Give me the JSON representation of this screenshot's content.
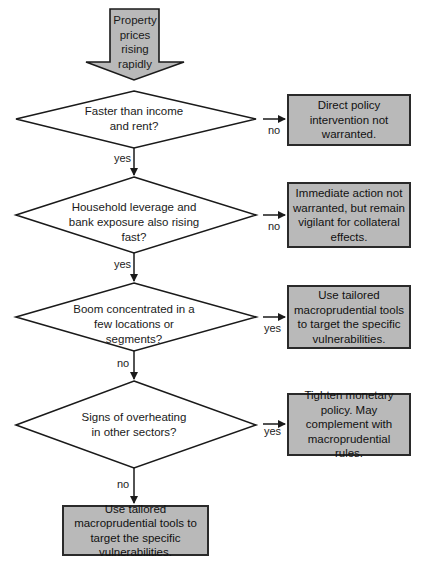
{
  "start": {
    "label": "Property prices rising rapidly"
  },
  "decisions": [
    {
      "question": "Faster than income and rent?",
      "branch_label": "no",
      "continue_label": "yes",
      "outcome": "Direct policy intervention not warranted."
    },
    {
      "question": "Household leverage and bank exposure also rising fast?",
      "branch_label": "no",
      "continue_label": "yes",
      "outcome": "Immediate action not warranted, but remain vigilant for collateral effects."
    },
    {
      "question": "Boom concentrated in a few locations or segments?",
      "branch_label": "yes",
      "continue_label": "no",
      "outcome": "Use tailored macroprudential tools to target the specific vulnerabilities."
    },
    {
      "question": "Signs of overheating in other sectors?",
      "branch_label": "yes",
      "continue_label": "no",
      "outcome": "Tighten monetary policy. May complement with macroprudential rules."
    }
  ],
  "final": {
    "label": "Use tailored macroprudential tools to target the specific vulnerabilities."
  },
  "colors": {
    "fill": "#b9b9b9",
    "stroke": "#1a1a1a",
    "background": "#ffffff"
  }
}
